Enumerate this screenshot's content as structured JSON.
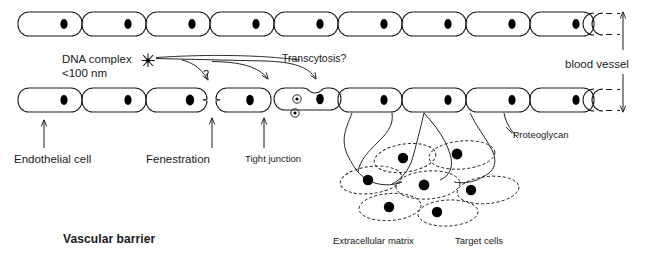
{
  "figure": {
    "colors": {
      "stroke": "#1a1a1a",
      "nucleus": "#000000",
      "background": "#ffffff"
    }
  },
  "labels": {
    "dna_complex_line1": "DNA complex",
    "dna_complex_line2": "<100 nm",
    "transcytosis": "Transcytosis?",
    "question_mark": "?",
    "blood_vessel": "blood vessel",
    "endothelial_cell": "Endothelial cell",
    "fenestration": "Fenestration",
    "tight_junction": "Tight junction",
    "proteoglycan": "Proteoglycan",
    "vascular_barrier": "Vascular barrier",
    "extracellular_matrix": "Extracellular matrix",
    "target_cells": "Target cells"
  },
  "diagram_data": {
    "type": "diagram",
    "top_row": {
      "name": "upper endothelial cell layer",
      "cell_count": 9,
      "partial_cell_right": true,
      "cell_y": 12,
      "cell_height": 24,
      "cell_width": 64,
      "first_cell_x": 18,
      "nucleus_offset_x": 46
    },
    "bottom_row": {
      "name": "lower endothelial cell layer",
      "cell_count": 9,
      "partial_cell_right": true,
      "cell_y": 88,
      "cell_height": 24,
      "cell_width": 64,
      "first_cell_x": 18,
      "nucleus_offset_x": 46,
      "features": {
        "fenestration_between_cells": [
          3,
          4
        ],
        "tight_junction_between_cells": [
          4,
          5
        ],
        "transcytosis_vesicles_in_cell": 5,
        "vesicle_count": 2
      }
    },
    "dna_complex_marker": {
      "x": 148,
      "y": 60,
      "glyph": "star-burst"
    },
    "pathway_arrows": [
      {
        "name": "fenestration-pathway",
        "label": "?",
        "target_x": 214,
        "target_y": 86
      },
      {
        "name": "paracellular-pathway",
        "target_x": 268,
        "target_y": 84
      },
      {
        "name": "transcytosis-pathway",
        "target_x": 314,
        "target_y": 84
      }
    ],
    "callout_arrows": [
      {
        "name": "endothelial-cell-arrow",
        "x": 44,
        "y_from": 146,
        "y_to": 120
      },
      {
        "name": "fenestration-arrow",
        "x": 212,
        "y_from": 146,
        "y_to": 118
      },
      {
        "name": "tight-junction-arrow",
        "x": 264,
        "y_from": 146,
        "y_to": 118
      }
    ],
    "blood_vessel_arrows": [
      {
        "name": "blood-vessel-arrow-up",
        "direction": "up",
        "x": 623,
        "y_from": 48,
        "y_to": 12
      },
      {
        "name": "blood-vessel-arrow-down",
        "direction": "down",
        "x": 623,
        "y_from": 76,
        "y_to": 112
      }
    ],
    "proteoglycan_strands": 4,
    "target_cells": {
      "count": 7,
      "style": "dashed ellipse with solid nucleus"
    }
  }
}
